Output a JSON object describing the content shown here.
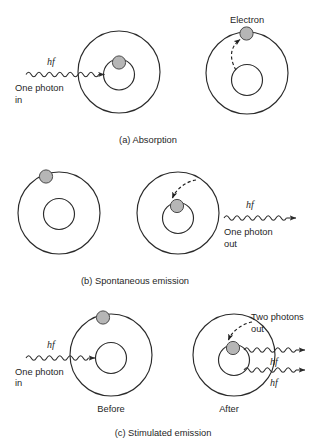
{
  "figure": {
    "background_color": "#ffffff",
    "stroke_color": "#2b2b2b",
    "electron_fill": "#b6b6b6",
    "electron_stroke": "#4a4a4a"
  },
  "panels": [
    {
      "id": "a",
      "caption": "(a) Absorption",
      "labels": {
        "photon_energy": "hf",
        "photon_in_line1": "One photon",
        "photon_in_line2": "in",
        "electron": "Electron"
      }
    },
    {
      "id": "b",
      "caption": "(b) Spontaneous emission",
      "labels": {
        "photon_energy": "hf",
        "photon_out_line1": "One photon",
        "photon_out_line2": "out"
      }
    },
    {
      "id": "c",
      "caption": "(c) Stimulated emission",
      "labels": {
        "photon_energy_in": "hf",
        "photon_in_line1": "One photon",
        "photon_in_line2": "in",
        "two_photons_line1": "Two photons",
        "two_photons_line2": "out",
        "photon_energy_out_1": "hf",
        "photon_energy_out_2": "hf",
        "before": "Before",
        "after": "After"
      }
    }
  ]
}
